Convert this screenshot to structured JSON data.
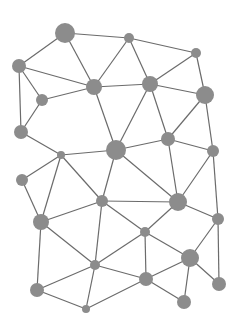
{
  "diagram": {
    "type": "network-graph",
    "width": 239,
    "height": 325,
    "colors": {
      "background": "#ffffff",
      "node": "#8c8c8c",
      "edge": "#6b6b6b"
    },
    "nodes": [
      {
        "id": "A",
        "x": 65,
        "y": 33,
        "r": 10
      },
      {
        "id": "B",
        "x": 129,
        "y": 38,
        "r": 5
      },
      {
        "id": "C",
        "x": 196,
        "y": 53,
        "r": 5
      },
      {
        "id": "D",
        "x": 19,
        "y": 66,
        "r": 7
      },
      {
        "id": "E",
        "x": 94,
        "y": 87,
        "r": 8
      },
      {
        "id": "F",
        "x": 150,
        "y": 84,
        "r": 8
      },
      {
        "id": "G",
        "x": 205,
        "y": 95,
        "r": 9
      },
      {
        "id": "H",
        "x": 42,
        "y": 100,
        "r": 6
      },
      {
        "id": "I",
        "x": 21,
        "y": 132,
        "r": 7
      },
      {
        "id": "J",
        "x": 168,
        "y": 139,
        "r": 7
      },
      {
        "id": "K",
        "x": 61,
        "y": 155,
        "r": 4
      },
      {
        "id": "L",
        "x": 116,
        "y": 150,
        "r": 10
      },
      {
        "id": "M",
        "x": 213,
        "y": 151,
        "r": 6
      },
      {
        "id": "N",
        "x": 22,
        "y": 180,
        "r": 6
      },
      {
        "id": "O",
        "x": 102,
        "y": 201,
        "r": 6
      },
      {
        "id": "P",
        "x": 178,
        "y": 202,
        "r": 9
      },
      {
        "id": "Q",
        "x": 41,
        "y": 222,
        "r": 8
      },
      {
        "id": "R",
        "x": 218,
        "y": 219,
        "r": 6
      },
      {
        "id": "S",
        "x": 145,
        "y": 232,
        "r": 5
      },
      {
        "id": "T",
        "x": 190,
        "y": 258,
        "r": 9
      },
      {
        "id": "U",
        "x": 95,
        "y": 265,
        "r": 5
      },
      {
        "id": "V",
        "x": 146,
        "y": 279,
        "r": 7
      },
      {
        "id": "W",
        "x": 37,
        "y": 290,
        "r": 7
      },
      {
        "id": "X",
        "x": 219,
        "y": 284,
        "r": 7
      },
      {
        "id": "Y",
        "x": 86,
        "y": 309,
        "r": 4
      },
      {
        "id": "Z",
        "x": 184,
        "y": 302,
        "r": 7
      }
    ],
    "edges": [
      [
        "A",
        "B"
      ],
      [
        "A",
        "D"
      ],
      [
        "A",
        "E"
      ],
      [
        "B",
        "E"
      ],
      [
        "B",
        "C"
      ],
      [
        "B",
        "F"
      ],
      [
        "C",
        "F"
      ],
      [
        "C",
        "G"
      ],
      [
        "D",
        "E"
      ],
      [
        "D",
        "H"
      ],
      [
        "D",
        "I"
      ],
      [
        "H",
        "E"
      ],
      [
        "H",
        "I"
      ],
      [
        "E",
        "F"
      ],
      [
        "E",
        "L"
      ],
      [
        "F",
        "G"
      ],
      [
        "F",
        "L"
      ],
      [
        "F",
        "J"
      ],
      [
        "G",
        "J"
      ],
      [
        "G",
        "M"
      ],
      [
        "I",
        "K"
      ],
      [
        "K",
        "L"
      ],
      [
        "K",
        "N"
      ],
      [
        "K",
        "O"
      ],
      [
        "K",
        "Q"
      ],
      [
        "L",
        "J"
      ],
      [
        "L",
        "O"
      ],
      [
        "L",
        "P"
      ],
      [
        "J",
        "M"
      ],
      [
        "J",
        "P"
      ],
      [
        "M",
        "P"
      ],
      [
        "M",
        "R"
      ],
      [
        "N",
        "Q"
      ],
      [
        "O",
        "P"
      ],
      [
        "O",
        "Q"
      ],
      [
        "O",
        "S"
      ],
      [
        "O",
        "U"
      ],
      [
        "P",
        "S"
      ],
      [
        "P",
        "R"
      ],
      [
        "S",
        "T"
      ],
      [
        "S",
        "U"
      ],
      [
        "R",
        "T"
      ],
      [
        "R",
        "X"
      ],
      [
        "T",
        "X"
      ],
      [
        "T",
        "V"
      ],
      [
        "T",
        "Z"
      ],
      [
        "S",
        "V"
      ],
      [
        "Q",
        "U"
      ],
      [
        "Q",
        "W"
      ],
      [
        "U",
        "W"
      ],
      [
        "U",
        "V"
      ],
      [
        "W",
        "Y"
      ],
      [
        "U",
        "Y"
      ],
      [
        "Y",
        "V"
      ],
      [
        "V",
        "Z"
      ]
    ]
  }
}
